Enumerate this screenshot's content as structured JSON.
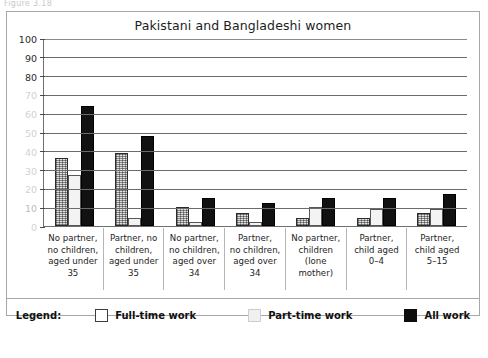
{
  "figure_caption": "Figure 3.18",
  "chart": {
    "title": "Pakistani and Bangladeshi women",
    "legend_label": "Legend:"
  },
  "chart_data": {
    "type": "bar",
    "title": "Pakistani and Bangladeshi women",
    "xlabel": "",
    "ylabel": "",
    "ylim": [
      0,
      100
    ],
    "yticks": [
      0,
      10,
      20,
      30,
      40,
      50,
      60,
      70,
      80,
      90,
      100
    ],
    "grid": true,
    "legend_position": "bottom",
    "categories": [
      "No partner, no children, aged under 35",
      "Partner, no children, aged under 35",
      "No partner, no children, aged over 34",
      "Partner, no children, aged over 34",
      "No partner, children (lone mother)",
      "Partner, child aged 0–4",
      "Partner, child aged 5–15"
    ],
    "series": [
      {
        "name": "Full-time work",
        "values": [
          36,
          39,
          10,
          7,
          4,
          4,
          7
        ]
      },
      {
        "name": "Part-time work",
        "values": [
          27,
          4,
          2,
          2,
          10,
          9,
          9
        ]
      },
      {
        "name": "All work",
        "values": [
          64,
          48,
          15,
          12,
          15,
          15,
          17
        ]
      }
    ]
  },
  "x_labels": [
    [
      "No partner,",
      "no children,",
      "aged under",
      "35"
    ],
    [
      "Partner, no",
      "children,",
      "aged under",
      "35"
    ],
    [
      "No partner,",
      "no children,",
      "aged over",
      "34"
    ],
    [
      "Partner,",
      "no children,",
      "aged over",
      "34"
    ],
    [
      "No partner,",
      "children",
      "(lone",
      "mother)"
    ],
    [
      "Partner,",
      "child aged",
      "0–4"
    ],
    [
      "Partner,",
      "child aged",
      "5–15"
    ]
  ],
  "legend": [
    {
      "label": "Full-time work",
      "swatch": "white-outlined-square",
      "color": "#ffffff"
    },
    {
      "label": "Part-time work",
      "swatch": "light-gray-square",
      "color": "#f0f0f0"
    },
    {
      "label": "All work",
      "swatch": "black-square",
      "color": "#0d0d0d"
    }
  ]
}
